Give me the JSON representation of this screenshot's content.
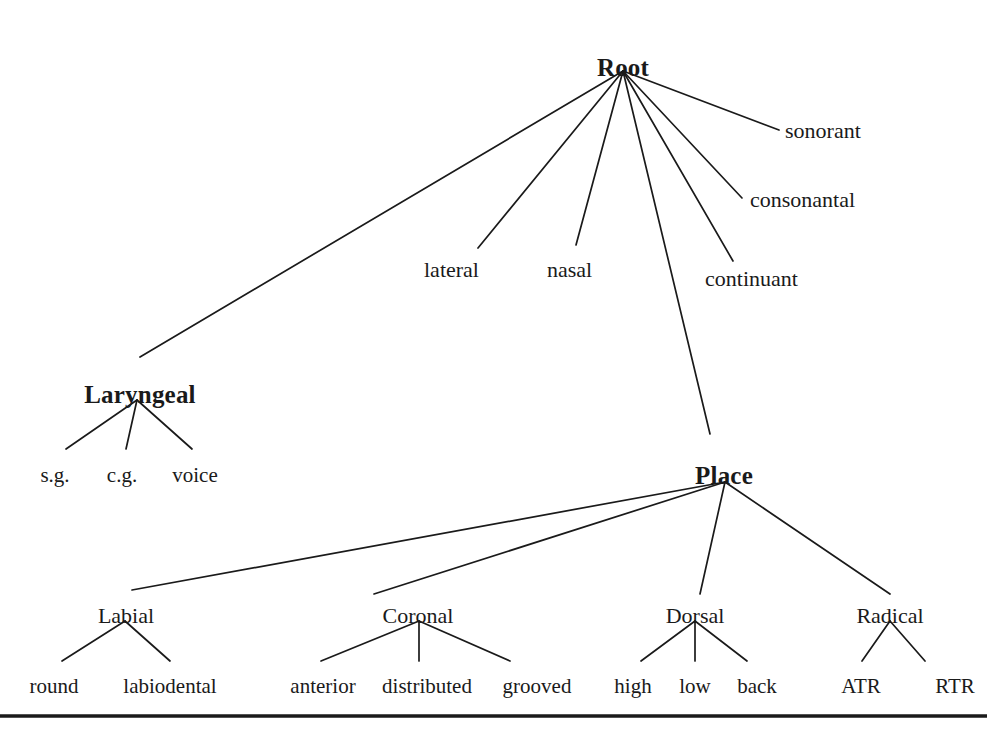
{
  "diagram": {
    "type": "tree",
    "background_color": "#ffffff",
    "line_color": "#1a1a1a",
    "nodes": {
      "root": {
        "label": "Root",
        "x": 623,
        "y": 55,
        "kind": "class"
      },
      "laryngeal": {
        "label": "Laryngeal",
        "x": 140,
        "y": 382,
        "kind": "class"
      },
      "place": {
        "label": "Place",
        "x": 724,
        "y": 463,
        "kind": "class"
      },
      "sonorant": {
        "label": "sonorant",
        "x": 785,
        "y": 120,
        "kind": "feature"
      },
      "consonantal": {
        "label": "consonantal",
        "x": 750,
        "y": 189,
        "kind": "feature"
      },
      "continuant": {
        "label": "continuant",
        "x": 705,
        "y": 268,
        "kind": "feature"
      },
      "lateral": {
        "label": "lateral",
        "x": 424,
        "y": 259,
        "kind": "feature"
      },
      "nasal": {
        "label": "nasal",
        "x": 547,
        "y": 259,
        "kind": "feature"
      },
      "sg": {
        "label": "s.g.",
        "x": 55,
        "y": 465,
        "kind": "leaf"
      },
      "cg": {
        "label": "c.g.",
        "x": 122,
        "y": 465,
        "kind": "leaf"
      },
      "voice": {
        "label": "voice",
        "x": 195,
        "y": 465,
        "kind": "leaf"
      },
      "labial": {
        "label": "Labial",
        "x": 126,
        "y": 605,
        "kind": "place"
      },
      "coronal": {
        "label": "Coronal",
        "x": 418,
        "y": 605,
        "kind": "place"
      },
      "dorsal": {
        "label": "Dorsal",
        "x": 695,
        "y": 605,
        "kind": "place"
      },
      "radical": {
        "label": "Radical",
        "x": 890,
        "y": 605,
        "kind": "place"
      },
      "round": {
        "label": "round",
        "x": 54,
        "y": 676,
        "kind": "leaf"
      },
      "labiodental": {
        "label": "labiodental",
        "x": 170,
        "y": 676,
        "kind": "leaf"
      },
      "anterior": {
        "label": "anterior",
        "x": 323,
        "y": 676,
        "kind": "leaf"
      },
      "distributed": {
        "label": "distributed",
        "x": 427,
        "y": 676,
        "kind": "leaf"
      },
      "grooved": {
        "label": "grooved",
        "x": 537,
        "y": 676,
        "kind": "leaf"
      },
      "high": {
        "label": "high",
        "x": 633,
        "y": 676,
        "kind": "leaf"
      },
      "low": {
        "label": "low",
        "x": 695,
        "y": 676,
        "kind": "leaf"
      },
      "back": {
        "label": "back",
        "x": 757,
        "y": 676,
        "kind": "leaf"
      },
      "atr": {
        "label": "ATR",
        "x": 861,
        "y": 676,
        "kind": "leaf"
      },
      "rtr": {
        "label": "RTR",
        "x": 955,
        "y": 676,
        "kind": "leaf"
      }
    },
    "edges": [
      {
        "from": "root",
        "to": "laryngeal",
        "x1": 623,
        "y1": 71,
        "x2": 140,
        "y2": 357
      },
      {
        "from": "root",
        "to": "lateral",
        "x1": 623,
        "y1": 71,
        "x2": 478,
        "y2": 248
      },
      {
        "from": "root",
        "to": "nasal",
        "x1": 623,
        "y1": 71,
        "x2": 576,
        "y2": 245
      },
      {
        "from": "root",
        "to": "place",
        "x1": 623,
        "y1": 71,
        "x2": 710,
        "y2": 434
      },
      {
        "from": "root",
        "to": "continuant",
        "x1": 623,
        "y1": 71,
        "x2": 733,
        "y2": 261
      },
      {
        "from": "root",
        "to": "consonantal",
        "x1": 623,
        "y1": 71,
        "x2": 742,
        "y2": 198
      },
      {
        "from": "root",
        "to": "sonorant",
        "x1": 623,
        "y1": 71,
        "x2": 779,
        "y2": 130
      },
      {
        "from": "laryngeal",
        "to": "sg",
        "x1": 137,
        "y1": 400,
        "x2": 66,
        "y2": 449
      },
      {
        "from": "laryngeal",
        "to": "cg",
        "x1": 137,
        "y1": 400,
        "x2": 126,
        "y2": 449
      },
      {
        "from": "laryngeal",
        "to": "voice",
        "x1": 137,
        "y1": 400,
        "x2": 192,
        "y2": 449
      },
      {
        "from": "place",
        "to": "labial",
        "x1": 725,
        "y1": 482,
        "x2": 132,
        "y2": 590
      },
      {
        "from": "place",
        "to": "coronal",
        "x1": 725,
        "y1": 482,
        "x2": 374,
        "y2": 594
      },
      {
        "from": "place",
        "to": "dorsal",
        "x1": 725,
        "y1": 482,
        "x2": 700,
        "y2": 594
      },
      {
        "from": "place",
        "to": "radical",
        "x1": 725,
        "y1": 482,
        "x2": 890,
        "y2": 594
      },
      {
        "from": "labial",
        "to": "round",
        "x1": 125,
        "y1": 621,
        "x2": 62,
        "y2": 661
      },
      {
        "from": "labial",
        "to": "labiodental",
        "x1": 125,
        "y1": 621,
        "x2": 170,
        "y2": 661
      },
      {
        "from": "coronal",
        "to": "anterior",
        "x1": 419,
        "y1": 621,
        "x2": 321,
        "y2": 661
      },
      {
        "from": "coronal",
        "to": "distributed",
        "x1": 419,
        "y1": 621,
        "x2": 419,
        "y2": 661
      },
      {
        "from": "coronal",
        "to": "grooved",
        "x1": 419,
        "y1": 621,
        "x2": 510,
        "y2": 661
      },
      {
        "from": "dorsal",
        "to": "high",
        "x1": 695,
        "y1": 621,
        "x2": 641,
        "y2": 661
      },
      {
        "from": "dorsal",
        "to": "low",
        "x1": 695,
        "y1": 621,
        "x2": 695,
        "y2": 661
      },
      {
        "from": "dorsal",
        "to": "back",
        "x1": 695,
        "y1": 621,
        "x2": 747,
        "y2": 661
      },
      {
        "from": "radical",
        "to": "atr",
        "x1": 890,
        "y1": 621,
        "x2": 862,
        "y2": 661
      },
      {
        "from": "radical",
        "to": "rtr",
        "x1": 890,
        "y1": 621,
        "x2": 925,
        "y2": 661
      }
    ],
    "rule_line": {
      "x1": 0,
      "y1": 716,
      "x2": 987,
      "y2": 716
    }
  }
}
